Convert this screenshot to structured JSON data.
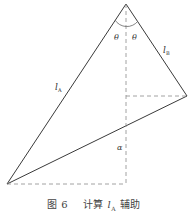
{
  "figure": {
    "caption_prefix": "图 6",
    "caption_text": "计算",
    "caption_var": "l",
    "caption_var_sub": "A",
    "caption_suffix": "辅助"
  },
  "labels": {
    "theta_left": "θ",
    "theta_right": "θ",
    "l_a": "l",
    "l_a_sub": "A",
    "l_b": "l",
    "l_b_sub": "B",
    "alpha": "α"
  },
  "colors": {
    "stroke": "#3a3a3a",
    "dash": "#8a8a8a",
    "text": "#333333"
  }
}
